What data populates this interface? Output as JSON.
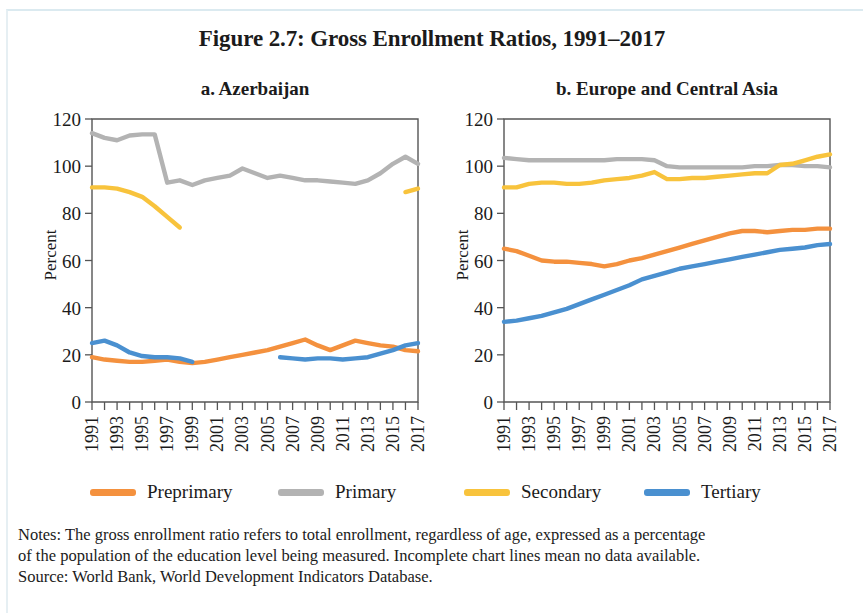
{
  "figure": {
    "title": "Figure 2.7: Gross Enrollment Ratios, 1991–2017"
  },
  "panels": [
    {
      "key": "a",
      "title": "a. Azerbaijan",
      "ylabel": "Percent"
    },
    {
      "key": "b",
      "title": "b. Europe and Central Asia",
      "ylabel": "Percent"
    }
  ],
  "legend": {
    "items": [
      {
        "label": "Preprimary",
        "color": "#F4913E"
      },
      {
        "label": "Primary",
        "color": "#B3B3B3"
      },
      {
        "label": "Secondary",
        "color": "#F8C33C"
      },
      {
        "label": "Tertiary",
        "color": "#4A90D0"
      }
    ]
  },
  "notes": {
    "line1": "Notes: The gross enrollment ratio refers to total enrollment, regardless of age, expressed as a percentage",
    "line2": "of the population of the education level being measured. Incomplete chart lines mean no data available.",
    "line3": "Source: World Bank, World Development Indicators Database."
  },
  "colors": {
    "preprimary": "#F4913E",
    "primary": "#B3B3B3",
    "secondary": "#F8C33C",
    "tertiary": "#4A90D0",
    "axis": "#555555",
    "text": "#1b1b1b",
    "background": "#ffffff"
  },
  "chart_data": [
    {
      "type": "line",
      "title": "a. Azerbaijan",
      "xlabel": "",
      "ylabel": "Percent",
      "ylim": [
        0,
        120
      ],
      "yticks": [
        0,
        20,
        40,
        60,
        80,
        100,
        120
      ],
      "xlim": [
        1991,
        2017
      ],
      "x": [
        1991,
        1992,
        1993,
        1994,
        1995,
        1996,
        1997,
        1998,
        1999,
        2000,
        2001,
        2002,
        2003,
        2004,
        2005,
        2006,
        2007,
        2008,
        2009,
        2010,
        2011,
        2012,
        2013,
        2014,
        2015,
        2016,
        2017
      ],
      "xticks": [
        1991,
        1993,
        1995,
        1997,
        1999,
        2001,
        2003,
        2005,
        2007,
        2009,
        2011,
        2013,
        2015,
        2017
      ],
      "xticklabels": [
        "1991",
        "1993",
        "1995",
        "1997",
        "1999",
        "2001",
        "2003",
        "2005",
        "2007",
        "2009",
        "2011",
        "2013",
        "2015",
        "2017"
      ],
      "grid": false,
      "legend_position": "bottom",
      "series": [
        {
          "name": "Preprimary",
          "color": "#F4913E",
          "values": [
            19,
            18,
            17.5,
            17,
            17,
            17.5,
            18,
            17,
            16.5,
            17,
            18,
            19,
            20,
            21,
            22,
            23.5,
            25,
            26.5,
            24,
            22,
            24,
            26,
            25,
            24,
            23.5,
            22,
            21.5
          ]
        },
        {
          "name": "Primary",
          "color": "#B3B3B3",
          "values": [
            114,
            112,
            111,
            113,
            113.5,
            113.5,
            93,
            94,
            92,
            94,
            95,
            96,
            99,
            97,
            95,
            96,
            95,
            94,
            94,
            93.5,
            93,
            92.5,
            94,
            97,
            101,
            104,
            101
          ]
        },
        {
          "name": "Secondary",
          "color": "#F8C33C",
          "values": [
            91,
            91,
            90.5,
            89,
            87,
            83,
            78.5,
            74,
            null,
            null,
            null,
            null,
            null,
            null,
            null,
            null,
            null,
            null,
            null,
            null,
            null,
            null,
            null,
            null,
            null,
            89,
            90.5
          ]
        },
        {
          "name": "Tertiary",
          "color": "#4A90D0",
          "values": [
            25,
            26,
            24,
            21,
            19.5,
            19,
            19,
            18.5,
            17,
            null,
            null,
            null,
            null,
            null,
            null,
            19,
            18.5,
            18,
            18.5,
            18.5,
            18,
            18.5,
            19,
            20.5,
            22,
            24,
            25
          ]
        }
      ]
    },
    {
      "type": "line",
      "title": "b. Europe and Central Asia",
      "xlabel": "",
      "ylabel": "Percent",
      "ylim": [
        0,
        120
      ],
      "yticks": [
        0,
        20,
        40,
        60,
        80,
        100,
        120
      ],
      "xlim": [
        1991,
        2017
      ],
      "x": [
        1991,
        1992,
        1993,
        1994,
        1995,
        1996,
        1997,
        1998,
        1999,
        2000,
        2001,
        2002,
        2003,
        2004,
        2005,
        2006,
        2007,
        2008,
        2009,
        2010,
        2011,
        2012,
        2013,
        2014,
        2015,
        2016,
        2017
      ],
      "xticks": [
        1991,
        1993,
        1995,
        1997,
        1999,
        2001,
        2003,
        2005,
        2007,
        2009,
        2011,
        2013,
        2015,
        2017
      ],
      "xticklabels": [
        "1991",
        "1993",
        "1995",
        "1997",
        "1999",
        "2001",
        "2003",
        "2005",
        "2007",
        "2009",
        "2011",
        "2013",
        "2015",
        "2017"
      ],
      "grid": false,
      "legend_position": "bottom",
      "series": [
        {
          "name": "Preprimary",
          "color": "#F4913E",
          "values": [
            65,
            64,
            62,
            60,
            59.5,
            59.5,
            59,
            58.5,
            57.5,
            58.5,
            60,
            61,
            62.5,
            64,
            65.5,
            67,
            68.5,
            70,
            71.5,
            72.5,
            72.5,
            72,
            72.5,
            73,
            73,
            73.5,
            73.5
          ]
        },
        {
          "name": "Primary",
          "color": "#B3B3B3",
          "values": [
            103.5,
            103,
            102.5,
            102.5,
            102.5,
            102.5,
            102.5,
            102.5,
            102.5,
            103,
            103,
            103,
            102.5,
            100,
            99.5,
            99.5,
            99.5,
            99.5,
            99.5,
            99.5,
            100,
            100,
            100.5,
            100.5,
            100,
            100,
            99.5
          ]
        },
        {
          "name": "Secondary",
          "color": "#F8C33C",
          "values": [
            91,
            91,
            92.5,
            93,
            93,
            92.5,
            92.5,
            93,
            94,
            94.5,
            95,
            96,
            97.5,
            94.5,
            94.5,
            95,
            95,
            95.5,
            96,
            96.5,
            97,
            97,
            100.5,
            101,
            102.5,
            104,
            105
          ]
        },
        {
          "name": "Tertiary",
          "color": "#4A90D0",
          "values": [
            34,
            34.5,
            35.5,
            36.5,
            38,
            39.5,
            41.5,
            43.5,
            45.5,
            47.5,
            49.5,
            52,
            53.5,
            55,
            56.5,
            57.5,
            58.5,
            59.5,
            60.5,
            61.5,
            62.5,
            63.5,
            64.5,
            65,
            65.5,
            66.5,
            67
          ]
        }
      ]
    }
  ]
}
